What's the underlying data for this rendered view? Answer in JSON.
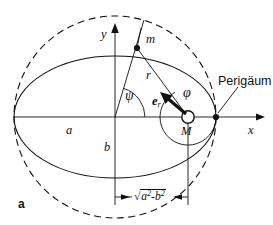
{
  "figure": {
    "panel_label": "a",
    "caption_labels": {
      "y_axis": "y",
      "x_axis": "x",
      "mass_point": "m",
      "radius": "r",
      "center_focus": "M",
      "semi_major": "a",
      "semi_minor": "b",
      "angle_psi": "ψ",
      "angle_phi": "φ",
      "unit_vector": "e",
      "unit_vector_sub": "r",
      "perigee": "Perigäum"
    },
    "dimension": {
      "radicand_first": "a",
      "radicand_first_exp": "2",
      "minus": "-",
      "radicand_second": "b",
      "radicand_second_exp": "2",
      "radical_sign": "√"
    },
    "colors": {
      "ink": "#111111",
      "paper": "#ffffff"
    },
    "geometry": {
      "center_x": 115,
      "center_y": 117,
      "semi_major_px": 101,
      "semi_minor_px": 61,
      "focus_x": 188,
      "perigee_x": 216,
      "point_m_x": 137,
      "point_m_y": 48
    }
  }
}
